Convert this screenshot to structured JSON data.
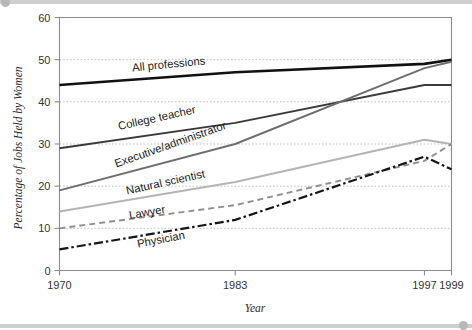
{
  "figure": {
    "background_color": "#ffffff",
    "frame_color": "#cfcfcf"
  },
  "chart_data": {
    "type": "line",
    "title": "",
    "xlabel": "Year",
    "ylabel": "Percentage of Jobs Held by Women",
    "xlim": [
      1970,
      1999
    ],
    "ylim": [
      0,
      60
    ],
    "xticks": [
      1970,
      1983,
      1997,
      1999
    ],
    "xticklabels": [
      "1970",
      "1983",
      "1997",
      "1999"
    ],
    "yticks": [
      0,
      10,
      20,
      30,
      40,
      50,
      60
    ],
    "yticklabels": [
      "0",
      "10",
      "20",
      "30",
      "40",
      "50",
      "60"
    ],
    "grid": "horizontal-dotted",
    "legend": "inline-labels",
    "x": [
      1970,
      1983,
      1997,
      1999
    ],
    "series": [
      {
        "name": "All professions",
        "values": [
          44,
          47,
          49,
          50
        ],
        "color": "#111111",
        "width": 2.6,
        "dash": "none",
        "label_x": 1975.4,
        "label_y": 47.2,
        "label_angle": -5.5
      },
      {
        "name": "College teacher",
        "values": [
          29,
          35,
          44,
          44
        ],
        "color": "#3a3a3a",
        "width": 1.9,
        "dash": "none",
        "label_x": 1974.4,
        "label_y": 33.3,
        "label_angle": -12.5
      },
      {
        "name": "Executive/administrator",
        "values": [
          19,
          30,
          48,
          49.5
        ],
        "color": "#6e6e6e",
        "width": 1.9,
        "dash": "none",
        "label_x": 1974.2,
        "label_y": 24.4,
        "label_angle": -19.5
      },
      {
        "name": "Natural scientist",
        "values": [
          14,
          21,
          31,
          30
        ],
        "color": "#b4b4b4",
        "width": 2.0,
        "dash": "none",
        "label_x": 1975.0,
        "label_y": 18.0,
        "label_angle": -12.5
      },
      {
        "name": "Lawyer",
        "values": [
          10,
          15.5,
          26,
          30
        ],
        "color": "#8f8f8f",
        "width": 1.9,
        "dash": "6 4",
        "label_x": 1975.2,
        "label_y": 12.2,
        "label_angle": -10.0
      },
      {
        "name": "Physician",
        "values": [
          5,
          12,
          27,
          24
        ],
        "color": "#151515",
        "width": 2.2,
        "dash": "9 3 2.5 3",
        "label_x": 1975.8,
        "label_y": 5.4,
        "label_angle": -11.0
      }
    ]
  }
}
